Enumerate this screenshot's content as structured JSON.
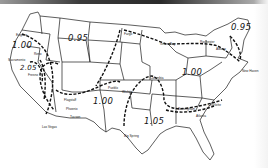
{
  "map": {
    "type": "isoline-map",
    "region": "Contiguous United States",
    "line_color": "#111111",
    "background": "#ffffff",
    "isoline_values": [
      {
        "label": "1.00",
        "x": 22,
        "y": 44
      },
      {
        "label": "0.95",
        "x": 73,
        "y": 37
      },
      {
        "label": "2.05",
        "x": 24,
        "y": 71
      },
      {
        "label": "1.00",
        "x": 97,
        "y": 103
      },
      {
        "label": "1.05",
        "x": 151,
        "y": 116
      },
      {
        "label": "1.00",
        "x": 179,
        "y": 72
      },
      {
        "label": "0.95",
        "x": 236,
        "y": 24
      }
    ],
    "cities": [
      {
        "name": "Eugene",
        "x": 18,
        "y": 33
      },
      {
        "name": "Reno",
        "x": 35,
        "y": 52
      },
      {
        "name": "Sacramento",
        "x": 10,
        "y": 58
      },
      {
        "name": "Fresno",
        "x": 28,
        "y": 71
      },
      {
        "name": "Las Vegas",
        "x": 42,
        "y": 125
      },
      {
        "name": "Flagstaff",
        "x": 66,
        "y": 97
      },
      {
        "name": "Phoenix",
        "x": 66,
        "y": 107
      },
      {
        "name": "Tucson",
        "x": 70,
        "y": 115
      },
      {
        "name": "Pueblo",
        "x": 115,
        "y": 86
      },
      {
        "name": "Wichita",
        "x": 122,
        "y": 89
      },
      {
        "name": "Columbia",
        "x": 152,
        "y": 77
      },
      {
        "name": "Big Spring",
        "x": 124,
        "y": 137
      },
      {
        "name": "Birmingham",
        "x": 180,
        "y": 108
      },
      {
        "name": "Atlanta",
        "x": 196,
        "y": 115
      },
      {
        "name": "Charlotte",
        "x": 208,
        "y": 104
      },
      {
        "name": "Fargo",
        "x": 124,
        "y": 30
      },
      {
        "name": "Green Bay",
        "x": 166,
        "y": 41
      },
      {
        "name": "Rochester",
        "x": 205,
        "y": 41
      },
      {
        "name": "Albany",
        "x": 220,
        "y": 47
      },
      {
        "name": "New Haven",
        "x": 240,
        "y": 71
      }
    ]
  }
}
